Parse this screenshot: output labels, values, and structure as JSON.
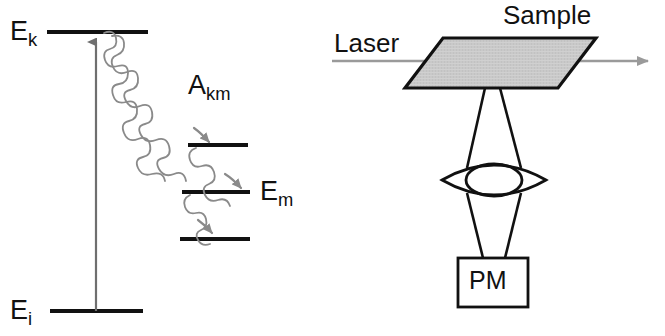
{
  "figure": {
    "title_visible": false,
    "background_color": "#ffffff",
    "ink_color": "#111111",
    "squiggle_color": "#8a8a8a",
    "laser_line_color": "#9a9a9a",
    "sample_fill_color": "#c9c9c9",
    "sample_edge_color": "#111111"
  },
  "left_panel": {
    "name": "energy-level-diagram",
    "labels": {
      "upper_level": {
        "base": "E",
        "sub": "k"
      },
      "lower_level": {
        "base": "E",
        "sub": "i"
      },
      "intermediate_level": {
        "base": "E",
        "sub": "m"
      },
      "transition_rate": {
        "base": "A",
        "sub": "km"
      }
    },
    "levels": [
      {
        "id": "Ek",
        "x1": 47,
        "x2": 148,
        "y": 32
      },
      {
        "id": "upper-cascade",
        "x1": 188,
        "x2": 248,
        "y": 145
      },
      {
        "id": "Em",
        "x1": 182,
        "x2": 250,
        "y": 192
      },
      {
        "id": "lower-cascade",
        "x1": 180,
        "x2": 250,
        "y": 239
      },
      {
        "id": "Ei",
        "x1": 50,
        "x2": 143,
        "y": 311
      }
    ],
    "excitation_arrow": {
      "x": 96,
      "y_from": 311,
      "y_to": 32,
      "direction": "up"
    },
    "emission_arrows": 3
  },
  "right_panel": {
    "name": "experimental-setup-diagram",
    "labels": {
      "laser": "Laser",
      "sample": "Sample",
      "detector": "PM"
    },
    "laser_beam": {
      "x_from": 332,
      "x_to": 655,
      "y": 61,
      "arrow": "right"
    },
    "sample_plate": {
      "top_left": [
        443,
        38
      ],
      "top_right": [
        596,
        38
      ],
      "bottom_right": [
        558,
        88
      ],
      "bottom_left": [
        405,
        88
      ]
    },
    "lens": {
      "cx": 494,
      "cy": 180,
      "half_width": 52,
      "half_height": 17
    },
    "detector_box": {
      "x": 458,
      "y": 258,
      "width": 70,
      "height": 49
    }
  }
}
